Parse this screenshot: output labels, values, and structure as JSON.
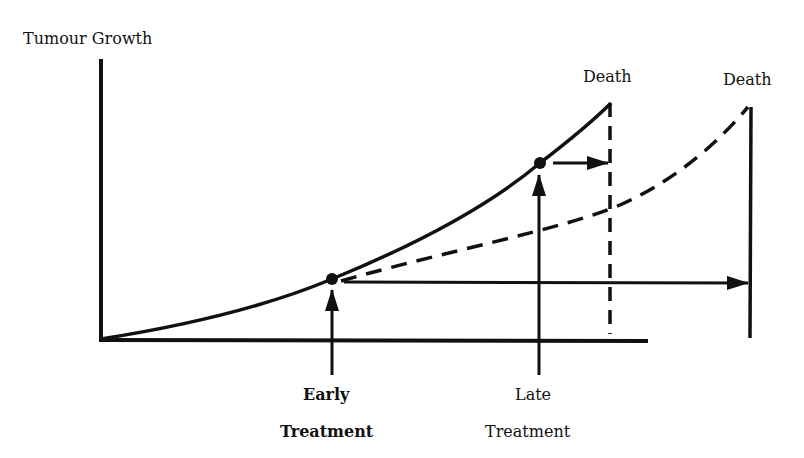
{
  "diagram": {
    "y_axis_label": "Tumour Growth",
    "death_label_untreated": "Death",
    "death_label_treated": "Death",
    "early_treatment": {
      "line1": "Early",
      "line2": "Treatment"
    },
    "late_treatment": {
      "line1": "Late",
      "line2": "Treatment"
    },
    "series": [
      {
        "name": "untreated-growth",
        "style": "solid"
      },
      {
        "name": "growth-after-early-treatment",
        "style": "dashed"
      }
    ],
    "colors": {
      "ink": "#111111",
      "background": "#ffffff"
    }
  }
}
